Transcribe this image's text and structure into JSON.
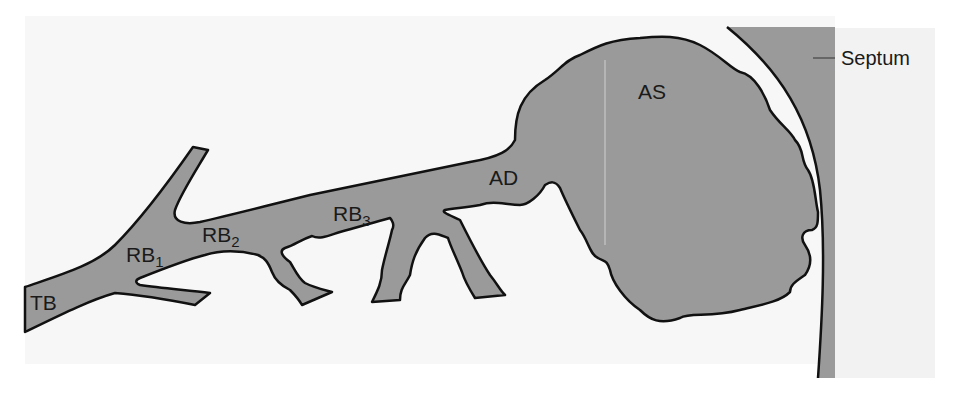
{
  "diagram": {
    "type": "anatomical schematic - respiratory airway branching",
    "colors": {
      "panel_background": "#f7f7f7",
      "airway_fill": "#9a9a9a",
      "septum_fill": "#9a9a9a",
      "outline": "#111111",
      "right_panel": "#f2f2f2"
    },
    "labels": {
      "tb": {
        "text": "TB"
      },
      "rb1": {
        "base": "RB",
        "sub": "1"
      },
      "rb2": {
        "base": "RB",
        "sub": "2"
      },
      "rb3": {
        "base": "RB",
        "sub": "3"
      },
      "ad": {
        "text": "AD"
      },
      "as": {
        "text": "AS"
      },
      "septum": {
        "text": "Septum"
      }
    }
  }
}
